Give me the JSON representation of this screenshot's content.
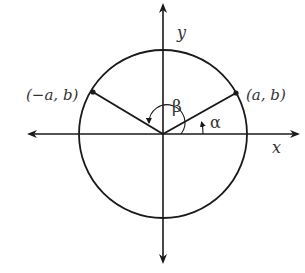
{
  "diagram": {
    "type": "unit-circle-angles",
    "center": [
      163,
      134
    ],
    "radius": 84,
    "axes": {
      "x_label": "x",
      "y_label": "y"
    },
    "points": [
      {
        "id": "p1",
        "label": "(a, b)",
        "pos": [
          236,
          93
        ]
      },
      {
        "id": "p2",
        "label": "(−a, b)",
        "pos": [
          93,
          92
        ]
      }
    ],
    "angles": [
      {
        "id": "alpha",
        "symbol": "α"
      },
      {
        "id": "beta",
        "symbol": "β"
      }
    ],
    "colors": {
      "stroke": "#1a1a1a",
      "text": "#333333"
    }
  }
}
